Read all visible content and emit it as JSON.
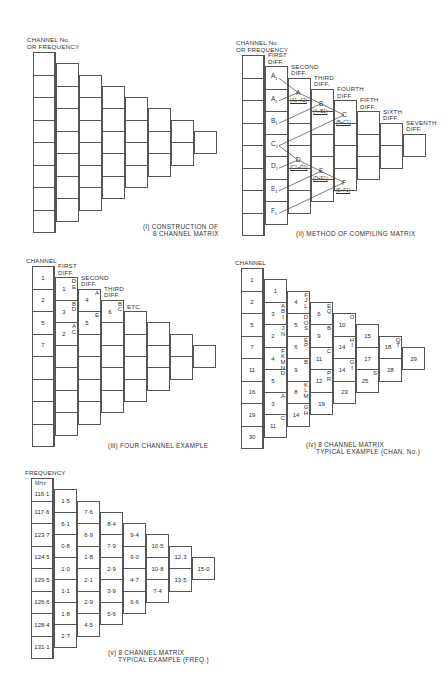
{
  "geometry": {
    "cell_w": 22,
    "cell_h": 22.5,
    "col_dx": 23,
    "col_dy": 11.25,
    "columns": 8
  },
  "diagrams": [
    {
      "id": "i",
      "origin": [
        33,
        52
      ],
      "header": [
        "CHANNEL No.",
        "OR FREQUENCY"
      ],
      "caption_prefix": "(i)",
      "caption": [
        "CONSTRUCTION OF",
        "8 CHANNEL MATRIX"
      ],
      "columns": []
    },
    {
      "id": "ii",
      "origin": [
        242,
        55
      ],
      "header": [
        "CHANNEL No.",
        "OR FREQUENCY"
      ],
      "caption_prefix": "(ii)",
      "caption": [
        "METHOD OF COMPILING MATRIX"
      ],
      "column_headers": [
        [
          "FIRST",
          "DIFF."
        ],
        [
          "SECOND",
          "DIFF."
        ],
        [
          "THIRD",
          "DIFF."
        ],
        [
          "FOURTH",
          "DIFF."
        ],
        [
          "FIFTH",
          "DIFF."
        ],
        [
          "SIXTH",
          "DIFF."
        ],
        [
          "SEVENTH",
          "DIFF."
        ]
      ],
      "first_diff_labels": [
        "A1",
        "A2",
        "B1",
        "C1",
        "D1",
        "E1",
        "F1"
      ],
      "derived_labels": [
        {
          "name": "A",
          "sum": "(A1+A2)"
        },
        {
          "name": "B",
          "sum": "(A+B1)"
        },
        {
          "name": "C",
          "sum": "(B+C1)"
        },
        {
          "name": "D",
          "sum": "(C1+D1)"
        },
        {
          "name": "E",
          "sum": "(D+E1)"
        },
        {
          "name": "F",
          "sum": "(E+F1)"
        }
      ]
    },
    {
      "id": "iii",
      "origin": [
        32,
        266
      ],
      "header": [
        "CHANNEL"
      ],
      "caption_prefix": "(iii)",
      "caption": [
        "FOUR  CHANNEL  EXAMPLE"
      ],
      "column_headers": [
        [
          "FIRST",
          "DIFF."
        ],
        [
          "SECOND",
          "DIFF."
        ],
        [
          "THIRD",
          "DIFF."
        ]
      ],
      "etc_label": "ETC.",
      "columns": [
        [
          "1",
          "2",
          "5",
          "7",
          "",
          "",
          "",
          ""
        ],
        [
          {
            "v": "1",
            "t": "DE"
          },
          {
            "v": "3",
            "t": "BD"
          },
          {
            "v": "2",
            "t": "AC"
          },
          "",
          "",
          "",
          "",
          ""
        ],
        [
          {
            "v": "4",
            "t": "A"
          },
          {
            "v": "5",
            "t": "E"
          },
          "",
          "",
          "",
          "",
          ""
        ],
        [
          {
            "v": "6",
            "t": "BC"
          },
          "",
          "",
          "",
          "",
          ""
        ],
        [
          "",
          "",
          "",
          ""
        ],
        [
          "",
          "",
          ""
        ],
        [
          "",
          ""
        ],
        [
          ""
        ]
      ]
    },
    {
      "id": "iv",
      "origin": [
        241,
        268
      ],
      "header": [
        "CHANNEL"
      ],
      "caption_prefix": "(iv)",
      "caption": [
        "8 CHANNEL  MATRIX",
        "TYPICAL  EXAMPLE  (CHAN. No.)"
      ],
      "columns": [
        [
          "1",
          "2",
          "5",
          "7",
          "11",
          "16",
          "19",
          "30"
        ],
        [
          "1",
          {
            "v": "3",
            "t": "ABI"
          },
          {
            "v": "2",
            "t": "JN"
          },
          {
            "v": "4",
            "t": "FKMNO"
          },
          {
            "v": "5",
            "t": "D"
          },
          {
            "v": "3",
            "t": "A"
          },
          {
            "v": "11",
            "t": "C"
          }
        ],
        [
          {
            "v": "4",
            "t": "FJL"
          },
          {
            "v": "5",
            "t": "DOS"
          },
          {
            "v": "6",
            "t": "EP"
          },
          {
            "v": "9",
            "t": "B"
          },
          {
            "v": "8",
            "t": "KLM"
          },
          {
            "v": "14",
            "t": "GH"
          }
        ],
        [
          {
            "v": "6",
            "t": "EQ"
          },
          {
            "v": "9",
            "t": "B"
          },
          {
            "v": "11",
            "t": "C"
          },
          {
            "v": "12",
            "t": "PR"
          },
          "19"
        ],
        [
          {
            "v": "10",
            "t": "O"
          },
          {
            "v": "14",
            "t": "HI"
          },
          {
            "v": "14",
            "t": "GI"
          },
          "23"
        ],
        [
          "15",
          "17",
          {
            "v": "25",
            "t": "S"
          }
        ],
        [
          {
            "v": "18",
            "t": "QT"
          },
          "28"
        ],
        [
          "29"
        ]
      ]
    },
    {
      "id": "v",
      "origin": [
        31,
        478
      ],
      "header": [
        "FREQUENCY"
      ],
      "unit": "MHz",
      "caption_prefix": "(v)",
      "caption": [
        "8 CHANNEL  MATRIX",
        "TYPICAL  EXAMPLE  (FREQ.)"
      ],
      "columns": [
        [
          "116·1",
          "117·6",
          "123·7",
          "124·5",
          "129·5",
          "126·6",
          "128·4",
          "131·1"
        ],
        [
          "1·5",
          "6·1",
          "0·8",
          "1·0",
          "1·1",
          "1·8",
          "2·7"
        ],
        [
          "7·6",
          "6·9",
          "1·8",
          "2·1",
          "2·9",
          "4·5"
        ],
        [
          "8·4",
          "7·9",
          "2·9",
          "3·9",
          "5·6"
        ],
        [
          "9·4",
          "9·0",
          "4·7",
          "6·6"
        ],
        [
          "10·5",
          "10·8",
          "7·4"
        ],
        [
          "12·3",
          "13·5"
        ],
        [
          "15·0"
        ]
      ]
    }
  ],
  "chart_data": {
    "type": "table",
    "panels": [
      {
        "id": "iv",
        "label": "8 CHANNEL MATRIX TYPICAL EXAMPLE (CHAN. No.)",
        "channels": [
          1,
          2,
          5,
          7,
          11,
          16,
          19,
          30
        ],
        "differences": [
          [
            1,
            3,
            2,
            4,
            5,
            3,
            11
          ],
          [
            4,
            5,
            6,
            9,
            8,
            14
          ],
          [
            6,
            9,
            11,
            12,
            19
          ],
          [
            10,
            14,
            14,
            23
          ],
          [
            15,
            17,
            25
          ],
          [
            18,
            28
          ],
          [
            29
          ]
        ]
      },
      {
        "id": "v",
        "label": "8 CHANNEL MATRIX TYPICAL EXAMPLE (FREQ.)",
        "unit": "MHz",
        "frequencies": [
          116.1,
          117.6,
          123.7,
          124.5,
          129.5,
          126.6,
          128.4,
          131.1
        ],
        "differences": [
          [
            1.5,
            6.1,
            0.8,
            1.0,
            1.1,
            1.8,
            2.7
          ],
          [
            7.6,
            6.9,
            1.8,
            2.1,
            2.9,
            4.5
          ],
          [
            8.4,
            7.9,
            2.9,
            3.9,
            5.6
          ],
          [
            9.4,
            9.0,
            4.7,
            6.6
          ],
          [
            10.5,
            10.8,
            7.4
          ],
          [
            12.3,
            13.5
          ],
          [
            15.0
          ]
        ]
      }
    ]
  }
}
